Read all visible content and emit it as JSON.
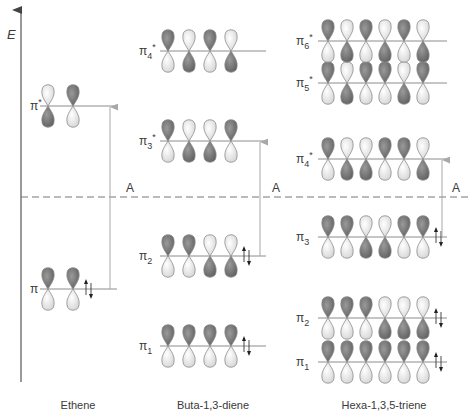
{
  "diagram": {
    "axis_label": "E",
    "threshold_label": "A",
    "colors": {
      "dark_lobe": "#7a7a7a",
      "light_lobe": "#f2f2f2",
      "lobe_stroke": "#8a8a8a",
      "level_line": "#8c8c8c",
      "axis": "#555555",
      "dashed_line": "#777777",
      "transition_arrow": "#a8a8a8",
      "text": "#3a3a3a"
    },
    "columns": [
      {
        "name": "Ethene",
        "levels": [
          {
            "label": "π",
            "sub": "",
            "star": false,
            "occupied": true,
            "phases": [
              "D",
              "D"
            ]
          },
          {
            "label": "π",
            "sub": "",
            "star": true,
            "occupied": false,
            "phases": [
              "L",
              "D"
            ]
          }
        ],
        "transition": {
          "from": "π",
          "to": "π*"
        }
      },
      {
        "name": "Buta-1,3-diene",
        "levels": [
          {
            "label": "π",
            "sub": "1",
            "star": false,
            "occupied": true,
            "phases": [
              "D",
              "D",
              "D",
              "D"
            ]
          },
          {
            "label": "π",
            "sub": "2",
            "star": false,
            "occupied": true,
            "phases": [
              "D",
              "D",
              "L",
              "L"
            ]
          },
          {
            "label": "π",
            "sub": "3",
            "star": true,
            "occupied": false,
            "phases": [
              "D",
              "L",
              "L",
              "D"
            ]
          },
          {
            "label": "π",
            "sub": "4",
            "star": true,
            "occupied": false,
            "phases": [
              "D",
              "L",
              "D",
              "L"
            ]
          }
        ],
        "transition": {
          "from": "π2",
          "to": "π3*"
        }
      },
      {
        "name": "Hexa-1,3,5-triene",
        "levels": [
          {
            "label": "π",
            "sub": "1",
            "star": false,
            "occupied": true,
            "phases": [
              "D",
              "D",
              "D",
              "D",
              "D",
              "D"
            ]
          },
          {
            "label": "π",
            "sub": "2",
            "star": false,
            "occupied": true,
            "phases": [
              "D",
              "D",
              "D",
              "L",
              "L",
              "L"
            ]
          },
          {
            "label": "π",
            "sub": "3",
            "star": false,
            "occupied": true,
            "phases": [
              "D",
              "D",
              "L",
              "L",
              "D",
              "D"
            ]
          },
          {
            "label": "π",
            "sub": "4",
            "star": true,
            "occupied": false,
            "phases": [
              "D",
              "L",
              "L",
              "D",
              "D",
              "L"
            ]
          },
          {
            "label": "π",
            "sub": "5",
            "star": true,
            "occupied": false,
            "phases": [
              "D",
              "L",
              "D",
              "D",
              "L",
              "D"
            ]
          },
          {
            "label": "π",
            "sub": "6",
            "star": true,
            "occupied": false,
            "phases": [
              "D",
              "L",
              "D",
              "L",
              "D",
              "L"
            ]
          }
        ],
        "transition": {
          "from": "π3",
          "to": "π4*"
        }
      }
    ]
  }
}
